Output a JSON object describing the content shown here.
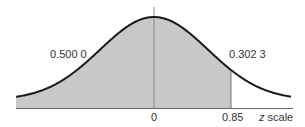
{
  "chart_data": {
    "type": "area",
    "title": "",
    "xlabel": "z scale",
    "ylabel": "",
    "x_ticks": [
      "0",
      "0.85"
    ],
    "annotations": [
      {
        "text": "0.500 0",
        "region": "left of 0",
        "meaning": "area from -infinity to 0"
      },
      {
        "text": "0.302 3",
        "region": "between 0 and 0.85",
        "meaning": "area from 0 to 0.85"
      }
    ],
    "shaded_region": {
      "from": "-inf",
      "to": 0.85
    },
    "curve": "standard normal density",
    "grid": false,
    "legend": null
  },
  "labels": {
    "left_area": "0.500 0",
    "right_area": "0.302 3",
    "tick_zero": "0",
    "tick_085": "0.85",
    "z_letter": "z",
    "scale_word": " scale"
  },
  "colors": {
    "shade": "#c8c8c8",
    "curve": "#1a1a1a",
    "axis": "#777777"
  }
}
